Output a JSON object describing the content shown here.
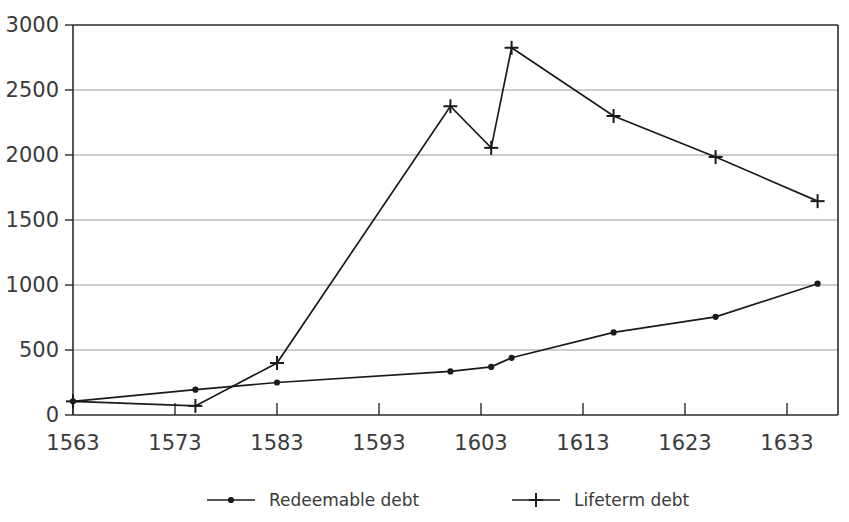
{
  "chart_data": {
    "type": "line",
    "title": "",
    "subtitle": "",
    "xlabel": "",
    "ylabel": "",
    "xlim": [
      1563,
      1638
    ],
    "ylim": [
      0,
      3000
    ],
    "grid": true,
    "legend_position": "bottom",
    "x_ticks": [
      1563,
      1573,
      1583,
      1593,
      1603,
      1613,
      1623,
      1633
    ],
    "x_tick_labels": [
      "1563",
      "1573",
      "1583",
      "1593",
      "1603",
      "1613",
      "1623",
      "1633"
    ],
    "y_ticks": [
      0,
      500,
      1000,
      1500,
      2000,
      2500,
      3000
    ],
    "y_tick_labels": [
      "0",
      "500",
      "1000",
      "1500",
      "2000",
      "2500",
      "3000"
    ],
    "series": [
      {
        "name": "Redeemable debt",
        "marker": "dot",
        "points": [
          {
            "x": 1563,
            "y": 105
          },
          {
            "x": 1575,
            "y": 195
          },
          {
            "x": 1583,
            "y": 250
          },
          {
            "x": 1600,
            "y": 335
          },
          {
            "x": 1604,
            "y": 370
          },
          {
            "x": 1606,
            "y": 440
          },
          {
            "x": 1616,
            "y": 635
          },
          {
            "x": 1626,
            "y": 755
          },
          {
            "x": 1636,
            "y": 1010
          }
        ]
      },
      {
        "name": "Lifeterm debt",
        "marker": "plus",
        "points": [
          {
            "x": 1563,
            "y": 105
          },
          {
            "x": 1575,
            "y": 70
          },
          {
            "x": 1583,
            "y": 400
          },
          {
            "x": 1600,
            "y": 2375
          },
          {
            "x": 1604,
            "y": 2055
          },
          {
            "x": 1606,
            "y": 2825
          },
          {
            "x": 1616,
            "y": 2300
          },
          {
            "x": 1626,
            "y": 1985
          },
          {
            "x": 1636,
            "y": 1645
          }
        ]
      }
    ]
  },
  "legend": {
    "items": [
      {
        "label": "Redeemable debt",
        "marker": "dot"
      },
      {
        "label": "Lifeterm debt",
        "marker": "plus"
      }
    ]
  },
  "colors": {
    "line": "#1a1a1a",
    "grid": "#8f8f8f",
    "frame": "#2b2b2b",
    "text": "#3a3a3a",
    "background": "#ffffff"
  }
}
